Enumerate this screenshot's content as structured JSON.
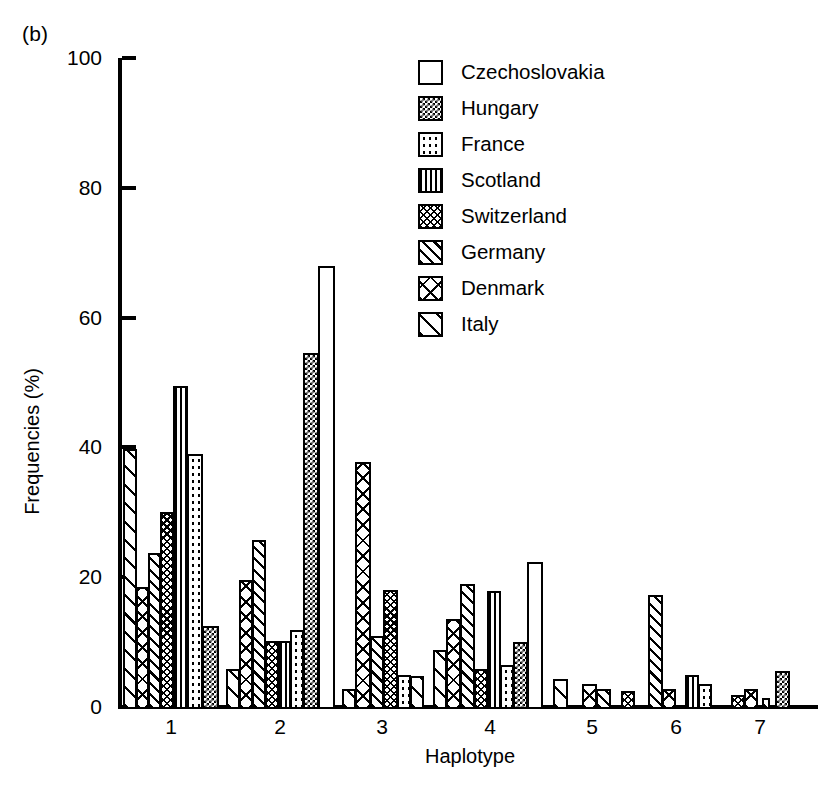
{
  "panel_label": "(b)",
  "caption": "Figure 13.1  Geographic...",
  "axes": {
    "ylabel": "Frequencies (%)",
    "xlabel": "Haplotype",
    "yticks": [
      0,
      20,
      40,
      60,
      80,
      100
    ],
    "xticks": [
      "1",
      "2",
      "3",
      "4",
      "5",
      "6",
      "7"
    ],
    "ylim": [
      0,
      100
    ]
  },
  "legend": {
    "position": "top-right",
    "items": [
      {
        "label": "Czechoslovakia",
        "pattern": "solid-white"
      },
      {
        "label": "Hungary",
        "pattern": "blocky-check"
      },
      {
        "label": "France",
        "pattern": "dots"
      },
      {
        "label": "Scotland",
        "pattern": "vertical-lines"
      },
      {
        "label": "Switzerland",
        "pattern": "fine-crosshatch"
      },
      {
        "label": "Germany",
        "pattern": "diagonal-hatch"
      },
      {
        "label": "Denmark",
        "pattern": "cross-x"
      },
      {
        "label": "Italy",
        "pattern": "sparse-diagonal"
      }
    ]
  },
  "chart_data": {
    "type": "bar",
    "title": "",
    "xlabel": "Haplotype",
    "ylabel": "Frequencies (%)",
    "ylim": [
      0,
      100
    ],
    "grid": false,
    "categories": [
      "1",
      "2",
      "3",
      "4",
      "5",
      "6",
      "7"
    ],
    "series": [
      {
        "name": "Czechoslovakia",
        "pattern": "solid-white",
        "values": [
          0,
          68,
          0,
          22.3,
          0,
          0,
          0
        ]
      },
      {
        "name": "Hungary",
        "pattern": "blocky-check",
        "values": [
          12.5,
          54.5,
          0,
          10,
          0,
          0,
          5.5
        ]
      },
      {
        "name": "France",
        "pattern": "dots",
        "values": [
          39,
          11.8,
          5,
          6.5,
          0,
          3.5,
          0
        ]
      },
      {
        "name": "Scotland",
        "pattern": "vertical-lines",
        "values": [
          49.5,
          10.2,
          0,
          17.8,
          0,
          5,
          0
        ]
      },
      {
        "name": "Switzerland",
        "pattern": "fine-crosshatch",
        "values": [
          30,
          10.2,
          18,
          5.8,
          2.5,
          0,
          1.8
        ]
      },
      {
        "name": "Germany",
        "pattern": "diagonal-hatch",
        "values": [
          23.8,
          25.8,
          11,
          19,
          2.8,
          17.3,
          0
        ]
      },
      {
        "name": "Denmark",
        "pattern": "cross-x",
        "values": [
          18.5,
          19.6,
          37.8,
          13.5,
          3.5,
          1,
          0
        ]
      },
      {
        "name": "Italy",
        "pattern": "sparse-diagonal",
        "values": [
          39.8,
          5.8,
          2.8,
          8.8,
          4.3,
          2.8,
          0
        ]
      }
    ]
  },
  "bars": [
    {
      "group": "1",
      "series": "Italy",
      "value": 39.8,
      "pattern": "italy",
      "x": 123,
      "w": 14
    },
    {
      "group": "1",
      "series": "Denmark",
      "value": 18.5,
      "pattern": "denmark",
      "x": 136,
      "w": 13
    },
    {
      "group": "1",
      "series": "Germany",
      "value": 23.8,
      "pattern": "germany",
      "x": 148,
      "w": 13
    },
    {
      "group": "1",
      "series": "Switzerland",
      "value": 30,
      "pattern": "switzerland",
      "x": 160,
      "w": 14
    },
    {
      "group": "1",
      "series": "Scotland",
      "value": 49.5,
      "pattern": "scotland",
      "x": 173,
      "w": 15
    },
    {
      "group": "1",
      "series": "France",
      "value": 39,
      "pattern": "france",
      "x": 187,
      "w": 16
    },
    {
      "group": "1",
      "series": "Hungary",
      "value": 12.5,
      "pattern": "hungary",
      "x": 202,
      "w": 17
    },
    {
      "group": "2",
      "series": "Italy",
      "value": 5.8,
      "pattern": "italy",
      "x": 226,
      "w": 14
    },
    {
      "group": "2",
      "series": "Denmark",
      "value": 19.6,
      "pattern": "denmark",
      "x": 239,
      "w": 14
    },
    {
      "group": "2",
      "series": "Germany",
      "value": 25.8,
      "pattern": "germany",
      "x": 252,
      "w": 14
    },
    {
      "group": "2",
      "series": "Switzerland",
      "value": 10.2,
      "pattern": "switzerland",
      "x": 265,
      "w": 14
    },
    {
      "group": "2",
      "series": "Scotland",
      "value": 10.2,
      "pattern": "scotland",
      "x": 278,
      "w": 13
    },
    {
      "group": "2",
      "series": "France",
      "value": 11.8,
      "pattern": "france",
      "x": 290,
      "w": 14
    },
    {
      "group": "2",
      "series": "Hungary",
      "value": 54.5,
      "pattern": "hungary",
      "x": 303,
      "w": 16
    },
    {
      "group": "2",
      "series": "Czechoslovakia",
      "value": 68,
      "pattern": "solidwhite",
      "x": 318,
      "w": 17
    },
    {
      "group": "3",
      "series": "Italy",
      "value": 2.8,
      "pattern": "italy",
      "x": 342,
      "w": 14
    },
    {
      "group": "3",
      "series": "Denmark",
      "value": 37.8,
      "pattern": "denmark",
      "x": 355,
      "w": 16
    },
    {
      "group": "3",
      "series": "Germany",
      "value": 11,
      "pattern": "germany",
      "x": 370,
      "w": 14
    },
    {
      "group": "3",
      "series": "Switzerland",
      "value": 18,
      "pattern": "switzerland",
      "x": 383,
      "w": 15
    },
    {
      "group": "3",
      "series": "France",
      "value": 5,
      "pattern": "france",
      "x": 397,
      "w": 14
    },
    {
      "group": "3",
      "series": "Hungary",
      "value": 0,
      "pattern": "hungary",
      "x": 410,
      "w": 0
    },
    {
      "group": "3",
      "series": "Italy2",
      "value": 4.8,
      "pattern": "italy",
      "x": 410,
      "w": 14
    },
    {
      "group": "4",
      "series": "Italy",
      "value": 8.8,
      "pattern": "italy",
      "x": 433,
      "w": 14
    },
    {
      "group": "4",
      "series": "Denmark",
      "value": 13.5,
      "pattern": "denmark",
      "x": 446,
      "w": 15
    },
    {
      "group": "4",
      "series": "Germany",
      "value": 19,
      "pattern": "germany",
      "x": 460,
      "w": 15
    },
    {
      "group": "4",
      "series": "Switzerland",
      "value": 5.8,
      "pattern": "switzerland",
      "x": 474,
      "w": 14
    },
    {
      "group": "4",
      "series": "Scotland",
      "value": 17.8,
      "pattern": "scotland",
      "x": 487,
      "w": 14
    },
    {
      "group": "4",
      "series": "France",
      "value": 6.5,
      "pattern": "france",
      "x": 500,
      "w": 14
    },
    {
      "group": "4",
      "series": "Hungary",
      "value": 10,
      "pattern": "hungary",
      "x": 513,
      "w": 15
    },
    {
      "group": "4",
      "series": "Czechoslovakia",
      "value": 22.3,
      "pattern": "solidwhite",
      "x": 527,
      "w": 16
    },
    {
      "group": "5",
      "series": "Italy",
      "value": 4.3,
      "pattern": "italy",
      "x": 553,
      "w": 15
    },
    {
      "group": "5",
      "series": "Denmark",
      "value": 3.5,
      "pattern": "denmark",
      "x": 582,
      "w": 15
    },
    {
      "group": "5",
      "series": "Germany",
      "value": 2.8,
      "pattern": "germany",
      "x": 596,
      "w": 15
    },
    {
      "group": "5",
      "series": "Switzerland",
      "value": 2.5,
      "pattern": "switzerland",
      "x": 621,
      "w": 14
    },
    {
      "group": "6",
      "series": "Germany",
      "value": 17.3,
      "pattern": "germany",
      "x": 648,
      "w": 15
    },
    {
      "group": "6",
      "series": "Denmark",
      "value": 2.8,
      "pattern": "denmark",
      "x": 662,
      "w": 14
    },
    {
      "group": "6",
      "series": "Scotland",
      "value": 5,
      "pattern": "scotland",
      "x": 685,
      "w": 14
    },
    {
      "group": "6",
      "series": "France",
      "value": 3.5,
      "pattern": "france",
      "x": 698,
      "w": 14
    },
    {
      "group": "7",
      "series": "Switzerland",
      "value": 1.8,
      "pattern": "switzerland",
      "x": 731,
      "w": 14
    },
    {
      "group": "7",
      "series": "Denmark",
      "value": 2.8,
      "pattern": "denmark",
      "x": 744,
      "w": 14
    },
    {
      "group": "7",
      "series": "Italy",
      "value": 1.4,
      "pattern": "italy",
      "x": 762,
      "w": 8
    },
    {
      "group": "7",
      "series": "Hungary",
      "value": 5.5,
      "pattern": "hungary",
      "x": 775,
      "w": 15
    }
  ]
}
